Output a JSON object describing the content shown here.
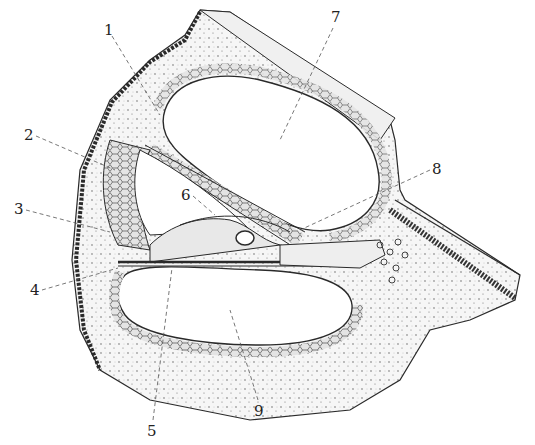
{
  "figure": {
    "ink_color": "#2a2a2a",
    "tissue_fill": "#f2f2f2",
    "cell_fill": "#dcdcdc"
  },
  "labels": [
    {
      "num": "1",
      "x": 104,
      "y": 23
    },
    {
      "num": "2",
      "x": 24,
      "y": 128
    },
    {
      "num": "3",
      "x": 14,
      "y": 202
    },
    {
      "num": "4",
      "x": 30,
      "y": 283
    },
    {
      "num": "5",
      "x": 147,
      "y": 424
    },
    {
      "num": "6",
      "x": 181,
      "y": 188
    },
    {
      "num": "7",
      "x": 331,
      "y": 10
    },
    {
      "num": "8",
      "x": 432,
      "y": 162
    },
    {
      "num": "9",
      "x": 254,
      "y": 404
    }
  ]
}
